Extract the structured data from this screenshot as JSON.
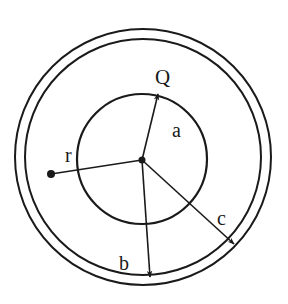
{
  "diagram": {
    "labels": {
      "charge": "Q",
      "inner_radius": "a",
      "shell_inner_radius": "b",
      "shell_outer_radius": "c",
      "point_distance": "r"
    },
    "colors": {
      "stroke": "#1a1a1a",
      "background": "#ffffff"
    }
  }
}
